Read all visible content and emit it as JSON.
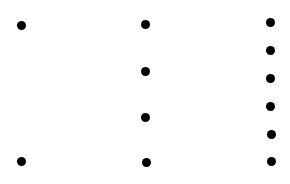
{
  "diagram": {
    "dot_color": "#000000",
    "background": "#ffffff",
    "dot_diameter": 9,
    "columns": [
      {
        "name": "column-1",
        "count": 2,
        "points": [
          {
            "x": 21,
            "y": 25
          },
          {
            "x": 21,
            "y": 161
          }
        ]
      },
      {
        "name": "column-2",
        "count": 4,
        "points": [
          {
            "x": 145,
            "y": 24
          },
          {
            "x": 145,
            "y": 71
          },
          {
            "x": 145,
            "y": 117
          },
          {
            "x": 146,
            "y": 162
          }
        ]
      },
      {
        "name": "column-3",
        "count": 6,
        "points": [
          {
            "x": 270,
            "y": 22
          },
          {
            "x": 270,
            "y": 50
          },
          {
            "x": 270,
            "y": 78
          },
          {
            "x": 270,
            "y": 106
          },
          {
            "x": 271,
            "y": 134
          },
          {
            "x": 271,
            "y": 161
          }
        ]
      }
    ]
  }
}
